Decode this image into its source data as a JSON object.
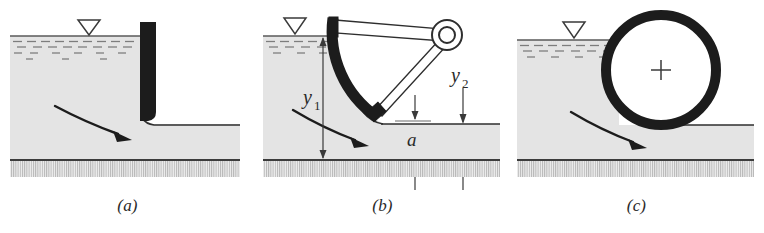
{
  "figure": {
    "panel_count": 3
  },
  "panels": [
    {
      "id": "a",
      "caption": "(a)",
      "name": "vertical-sluice-gate",
      "description": "Vertical sluice gate with free discharge",
      "has_water_surface_marker": true,
      "flow_arrow": true,
      "labels": []
    },
    {
      "id": "b",
      "caption": "(b)",
      "name": "tainter-radial-gate",
      "description": "Tainter (radial) gate with trunnion pivot and arms",
      "has_water_surface_marker": true,
      "flow_arrow": true,
      "labels": [
        {
          "text": "y",
          "sub": "1",
          "name": "upstream-depth-label"
        },
        {
          "text": "y",
          "sub": "2",
          "name": "downstream-depth-label"
        },
        {
          "text": "a",
          "sub": "",
          "name": "gate-opening-label"
        }
      ]
    },
    {
      "id": "c",
      "caption": "(c)",
      "name": "drum-roller-gate",
      "description": "Drum (roller) gate resting on channel bed",
      "has_water_surface_marker": true,
      "flow_arrow": true,
      "labels": []
    }
  ],
  "colors": {
    "water_fill": "#e2e2e2",
    "gate_dark": "#1a1a1a",
    "bed_line": "#3a3a3a",
    "hatch": "#9a9a9a",
    "text": "#2a2a2a",
    "background": "#ffffff"
  }
}
